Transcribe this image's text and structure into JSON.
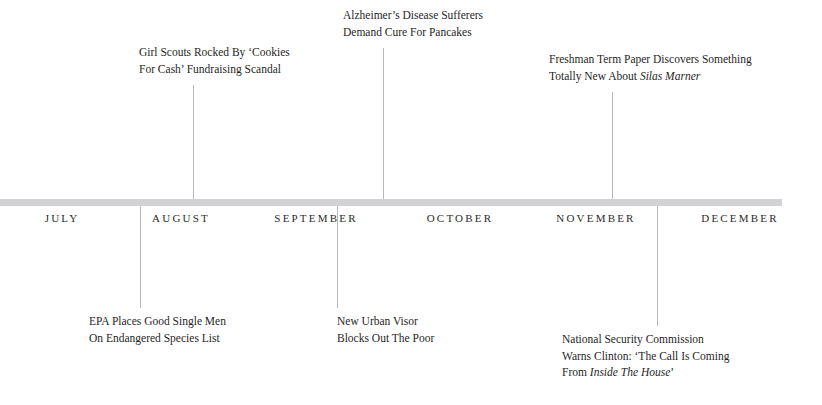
{
  "axis": {
    "bar_color": "#d2d2d4",
    "line_color": "#b9b9bb"
  },
  "months": [
    {
      "label": "JULY",
      "center_x": 62
    },
    {
      "label": "AUGUST",
      "center_x": 181
    },
    {
      "label": "SEPTEMBER",
      "center_x": 316
    },
    {
      "label": "OCTOBER",
      "center_x": 460
    },
    {
      "label": "NOVEMBER",
      "center_x": 596
    },
    {
      "label": "DECEMBER",
      "center_x": 740
    }
  ],
  "month_dividers": [
    {
      "x": 140
    },
    {
      "x": 337
    },
    {
      "x": 383
    },
    {
      "x": 612
    },
    {
      "x": 657
    }
  ],
  "events_above": [
    {
      "name": "girl-scouts",
      "line1": "Girl Scouts Rocked By ‘Cookies",
      "line2": "For Cash’ Fundraising Scandal",
      "text_left": 139,
      "text_top": 44,
      "tick_x": 193,
      "tick_top": 85,
      "tick_height": 114
    },
    {
      "name": "alzheimers-pancakes",
      "line1": "Alzheimer’s Disease Sufferers",
      "line2": "Demand Cure For Pancakes",
      "text_left": 343,
      "text_top": 7,
      "tick_x": 383,
      "tick_top": 48,
      "tick_height": 151
    },
    {
      "name": "silas-marner",
      "line1": "Freshman Term Paper Discovers Something",
      "line2_pre": "Totally New About ",
      "line2_em": "Silas Marner",
      "line2_post": "",
      "text_left": 549,
      "text_top": 51,
      "tick_x": 612,
      "tick_top": 92,
      "tick_height": 107
    }
  ],
  "events_below": [
    {
      "name": "epa-single-men",
      "line1": "EPA Places Good Single Men",
      "line2": "On Endangered Species List",
      "text_left": 89,
      "text_top": 313,
      "tick_x": 140,
      "tick_top": 234,
      "tick_height": 74
    },
    {
      "name": "urban-visor",
      "line1": "New Urban Visor",
      "line2": "Blocks Out The Poor",
      "text_left": 337,
      "text_top": 313,
      "tick_x": 337,
      "tick_top": 234,
      "tick_height": 74
    },
    {
      "name": "national-security-commission",
      "line1": "National Security Commission",
      "line2_pre": "Warns Clinton: ‘The Call Is Coming",
      "line3_pre": "From ",
      "line3_em": "Inside The House",
      "line3_post": "’",
      "text_left": 562,
      "text_top": 331,
      "tick_x": 657,
      "tick_top": 234,
      "tick_height": 92
    }
  ]
}
